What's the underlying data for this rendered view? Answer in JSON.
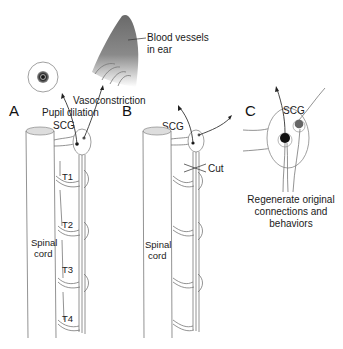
{
  "figure": {
    "panels": [
      {
        "id": "A",
        "label": "A",
        "spinal_cord_label": [
          "Spinal",
          "cord"
        ],
        "segments": [
          "T1",
          "T2",
          "T3",
          "T4"
        ],
        "ganglion_label": "SCG",
        "annotations": {
          "pupil": "Pupil dilation",
          "vaso": "Vasoconstriction",
          "ear": [
            "Blood vessels",
            "in ear"
          ]
        }
      },
      {
        "id": "B",
        "label": "B",
        "spinal_cord_label": [
          "Spinal",
          "cord"
        ],
        "ganglion_label": "SCG",
        "cut_label": "Cut"
      },
      {
        "id": "C",
        "label": "C",
        "ganglion_label": "SCG",
        "caption": [
          "Regenerate original",
          "connections and",
          "behaviors"
        ]
      }
    ],
    "colors": {
      "line": "#777777",
      "dark": "#222222",
      "neuron_black": "#111111",
      "neuron_gray": "#666666"
    }
  }
}
